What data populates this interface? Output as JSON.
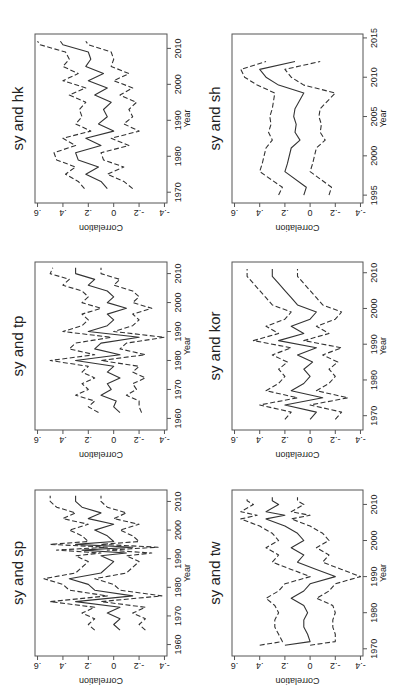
{
  "figure": {
    "layout": "2 columns x 3 rows, each panel rotated 90 degrees counter-clockwise",
    "line_color": "#333333",
    "frame_color": "#555555"
  },
  "chart_data": [
    {
      "type": "line",
      "title": "sy and hk",
      "xlabel": "Year",
      "ylabel": "Correlation",
      "xticks": [
        1970,
        1980,
        1990,
        2000,
        2010
      ],
      "yticks": [
        ".6",
        ".4",
        ".2",
        "0",
        "-.2",
        "-.4"
      ],
      "xlim": [
        1967,
        2014
      ],
      "ylim": [
        -0.42,
        0.62
      ],
      "x": [
        1971,
        1973,
        1975,
        1977,
        1979,
        1981,
        1983,
        1985,
        1987,
        1989,
        1991,
        1993,
        1995,
        1997,
        1999,
        2001,
        2003,
        2005,
        2007,
        2009,
        2011,
        2012
      ],
      "series": [
        {
          "name": "correlation",
          "style": "solid",
          "values": [
            0.05,
            0.1,
            0.22,
            0.12,
            0.28,
            0.3,
            0.1,
            0.22,
            0.0,
            0.12,
            0.05,
            0.08,
            0.02,
            0.15,
            0.05,
            0.2,
            0.08,
            0.22,
            0.18,
            0.2,
            0.4,
            0.42
          ]
        },
        {
          "name": "upper",
          "style": "dashed",
          "values": [
            0.23,
            0.28,
            0.38,
            0.3,
            0.45,
            0.47,
            0.3,
            0.4,
            0.18,
            0.3,
            0.25,
            0.27,
            0.22,
            0.35,
            0.22,
            0.4,
            0.28,
            0.4,
            0.35,
            0.38,
            0.58,
            0.6
          ]
        },
        {
          "name": "lower",
          "style": "dashed",
          "values": [
            -0.15,
            -0.08,
            0.05,
            -0.08,
            0.08,
            0.1,
            -0.12,
            0.02,
            -0.2,
            -0.08,
            -0.15,
            -0.12,
            -0.18,
            -0.05,
            -0.15,
            0.0,
            -0.12,
            0.02,
            0.0,
            0.02,
            0.2,
            0.22
          ]
        }
      ]
    },
    {
      "type": "line",
      "title": "sy and tp",
      "xlabel": "Year",
      "ylabel": "Correlation",
      "xticks": [
        1960,
        1970,
        1980,
        1990,
        2000,
        2010
      ],
      "yticks": [
        ".6",
        ".4",
        ".2",
        "0",
        "-.2",
        "-.4"
      ],
      "xlim": [
        1956,
        2014
      ],
      "ylim": [
        -0.42,
        0.62
      ],
      "x": [
        1962,
        1964,
        1966,
        1968,
        1970,
        1972,
        1974,
        1976,
        1978,
        1980,
        1982,
        1984,
        1986,
        1988,
        1990,
        1992,
        1994,
        1996,
        1998,
        2000,
        2002,
        2004,
        2006,
        2008,
        2010,
        2012
      ],
      "series": [
        {
          "name": "correlation",
          "style": "solid",
          "values": [
            -0.05,
            0.0,
            -0.02,
            0.1,
            0.02,
            0.05,
            -0.05,
            0.05,
            0.0,
            0.3,
            -0.05,
            0.15,
            0.1,
            -0.2,
            0.2,
            0.05,
            0.0,
            0.05,
            -0.1,
            0.05,
            0.0,
            0.05,
            0.2,
            0.15,
            0.3,
            0.3
          ]
        },
        {
          "name": "upper",
          "style": "dashed",
          "values": [
            0.12,
            0.2,
            0.15,
            0.3,
            0.2,
            0.25,
            0.15,
            0.25,
            0.2,
            0.5,
            0.15,
            0.35,
            0.3,
            0.02,
            0.4,
            0.25,
            0.2,
            0.25,
            0.1,
            0.25,
            0.2,
            0.25,
            0.4,
            0.35,
            0.5,
            0.48
          ]
        },
        {
          "name": "lower",
          "style": "dashed",
          "values": [
            -0.22,
            -0.2,
            -0.2,
            -0.1,
            -0.18,
            -0.15,
            -0.25,
            -0.15,
            -0.2,
            0.1,
            -0.25,
            -0.05,
            -0.1,
            -0.4,
            0.0,
            -0.15,
            -0.2,
            -0.15,
            -0.3,
            -0.15,
            -0.2,
            -0.15,
            0.0,
            -0.05,
            0.1,
            0.1
          ]
        }
      ]
    },
    {
      "type": "line",
      "title": "sy and sp",
      "xlabel": "Year",
      "ylabel": "Correlation",
      "xticks": [
        1960,
        1970,
        1980,
        1990,
        2000,
        2010
      ],
      "yticks": [
        ".6",
        ".4",
        ".2",
        "0",
        "-.2",
        "-.4"
      ],
      "xlim": [
        1956,
        2014
      ],
      "ylim": [
        -0.42,
        0.62
      ],
      "x": [
        1965,
        1967,
        1969,
        1971,
        1973,
        1975,
        1977,
        1979,
        1981,
        1983,
        1985,
        1987,
        1989,
        1991,
        1992,
        1993,
        1994,
        1995,
        1996,
        1998,
        2000,
        2002,
        2004,
        2006,
        2008,
        2010,
        2012
      ],
      "series": [
        {
          "name": "correlation",
          "style": "solid",
          "values": [
            -0.05,
            0.0,
            -0.05,
            0.05,
            -0.05,
            0.3,
            -0.15,
            0.15,
            0.2,
            0.35,
            0.1,
            0.05,
            0.0,
            0.1,
            -0.1,
            0.25,
            -0.15,
            0.3,
            0.0,
            0.05,
            0.15,
            0.0,
            0.2,
            0.1,
            0.25,
            0.3,
            0.3
          ]
        },
        {
          "name": "upper",
          "style": "dashed",
          "values": [
            0.15,
            0.2,
            0.15,
            0.25,
            0.15,
            0.5,
            0.05,
            0.35,
            0.4,
            0.55,
            0.3,
            0.25,
            0.2,
            0.3,
            0.1,
            0.45,
            0.05,
            0.5,
            0.2,
            0.25,
            0.35,
            0.2,
            0.4,
            0.3,
            0.45,
            0.5,
            0.5
          ]
        },
        {
          "name": "lower",
          "style": "dashed",
          "values": [
            -0.25,
            -0.2,
            -0.25,
            -0.15,
            -0.25,
            0.1,
            -0.38,
            -0.05,
            0.0,
            0.15,
            -0.1,
            -0.15,
            -0.2,
            -0.1,
            -0.3,
            0.05,
            -0.35,
            0.1,
            -0.2,
            -0.15,
            -0.05,
            -0.2,
            0.0,
            -0.1,
            0.05,
            0.1,
            0.1
          ]
        }
      ]
    },
    {
      "type": "line",
      "title": "sy and sh",
      "xlabel": "Year",
      "ylabel": "Correlation",
      "xticks": [
        1995,
        2000,
        2005,
        2010,
        2015
      ],
      "yticks": [
        ".6",
        ".4",
        ".2",
        "0",
        "-.2",
        "-.4"
      ],
      "xlim": [
        1994,
        2015.5
      ],
      "ylim": [
        -0.42,
        0.62
      ],
      "x": [
        1995,
        1996,
        1998,
        1999,
        2001,
        2002,
        2003,
        2004,
        2005,
        2006,
        2008,
        2009,
        2010,
        2011,
        2012
      ],
      "series": [
        {
          "name": "correlation",
          "style": "solid",
          "values": [
            0.05,
            0.03,
            0.2,
            0.18,
            0.15,
            0.08,
            0.12,
            0.11,
            0.13,
            0.12,
            0.05,
            0.25,
            0.35,
            0.4,
            0.12
          ]
        },
        {
          "name": "upper",
          "style": "dashed",
          "values": [
            0.25,
            0.22,
            0.4,
            0.38,
            0.35,
            0.3,
            0.33,
            0.31,
            0.32,
            0.3,
            0.28,
            0.42,
            0.52,
            0.55,
            0.35
          ]
        },
        {
          "name": "lower",
          "style": "dashed",
          "values": [
            -0.15,
            -0.17,
            0.0,
            -0.02,
            -0.05,
            -0.12,
            -0.08,
            -0.09,
            -0.07,
            -0.08,
            -0.2,
            0.05,
            0.15,
            0.2,
            -0.08
          ]
        }
      ]
    },
    {
      "type": "line",
      "title": "sy and kor",
      "xlabel": "Year",
      "ylabel": "Correlation",
      "xticks": [
        1970,
        1980,
        1990,
        2000,
        2010
      ],
      "yticks": [
        ".6",
        ".4",
        ".2",
        "0",
        "-.2",
        "-.4"
      ],
      "xlim": [
        1966,
        2013
      ],
      "ylim": [
        -0.42,
        0.62
      ],
      "x": [
        1969,
        1971,
        1973,
        1975,
        1977,
        1979,
        1981,
        1983,
        1985,
        1987,
        1989,
        1991,
        1993,
        1995,
        1997,
        1999,
        2001,
        2003,
        2005,
        2007,
        2009,
        2011
      ],
      "series": [
        {
          "name": "correlation",
          "style": "solid",
          "values": [
            0.0,
            -0.05,
            0.2,
            -0.1,
            0.15,
            0.05,
            0.0,
            0.05,
            -0.02,
            0.1,
            -0.05,
            0.25,
            0.05,
            0.15,
            0.0,
            -0.05,
            0.1,
            0.15,
            0.2,
            0.25,
            0.3,
            0.3
          ]
        },
        {
          "name": "upper",
          "style": "dashed",
          "values": [
            0.2,
            0.15,
            0.4,
            0.1,
            0.35,
            0.25,
            0.2,
            0.25,
            0.18,
            0.3,
            0.15,
            0.45,
            0.25,
            0.35,
            0.2,
            0.15,
            0.3,
            0.35,
            0.4,
            0.45,
            0.5,
            0.5
          ]
        },
        {
          "name": "lower",
          "style": "dashed",
          "values": [
            -0.2,
            -0.25,
            0.0,
            -0.3,
            -0.05,
            -0.15,
            -0.2,
            -0.15,
            -0.22,
            -0.1,
            -0.25,
            0.05,
            -0.15,
            -0.05,
            -0.2,
            -0.25,
            -0.1,
            -0.05,
            0.0,
            0.05,
            0.1,
            0.1
          ]
        }
      ]
    },
    {
      "type": "line",
      "title": "sy and tw",
      "xlabel": "Year",
      "ylabel": "Correlation",
      "xticks": [
        1970,
        1980,
        1990,
        2000,
        2010
      ],
      "yticks": [
        ".6",
        ".4",
        ".2",
        "0",
        "-.2",
        "-.4"
      ],
      "xlim": [
        1968,
        2014
      ],
      "ylim": [
        -0.42,
        0.62
      ],
      "x": [
        1971,
        1972,
        1974,
        1976,
        1978,
        1980,
        1982,
        1984,
        1986,
        1988,
        1990,
        1992,
        1994,
        1996,
        1998,
        2000,
        2002,
        2004,
        2006,
        2007,
        2008,
        2010,
        2011,
        2012
      ],
      "series": [
        {
          "name": "correlation",
          "style": "solid",
          "values": [
            0.2,
            0.0,
            0.02,
            0.05,
            0.05,
            0.02,
            0.05,
            0.15,
            0.05,
            0.0,
            -0.2,
            -0.05,
            0.1,
            0.05,
            0.15,
            0.05,
            0.1,
            0.2,
            0.35,
            0.2,
            0.35,
            0.25,
            0.3,
            0.3
          ]
        },
        {
          "name": "upper",
          "style": "dashed",
          "values": [
            0.4,
            0.22,
            0.25,
            0.28,
            0.28,
            0.25,
            0.28,
            0.35,
            0.25,
            0.2,
            0.0,
            0.15,
            0.3,
            0.25,
            0.35,
            0.25,
            0.3,
            0.4,
            0.55,
            0.42,
            0.55,
            0.45,
            0.5,
            0.5
          ]
        },
        {
          "name": "lower",
          "style": "dashed",
          "values": [
            0.0,
            -0.2,
            -0.2,
            -0.18,
            -0.18,
            -0.2,
            -0.18,
            -0.05,
            -0.15,
            -0.2,
            -0.4,
            -0.25,
            -0.1,
            -0.15,
            -0.05,
            -0.15,
            -0.1,
            0.0,
            0.15,
            0.0,
            0.15,
            0.05,
            0.1,
            0.1
          ]
        }
      ]
    }
  ]
}
